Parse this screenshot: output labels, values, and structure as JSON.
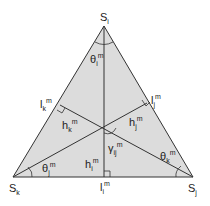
{
  "diagram": {
    "fill_color": "#dcdcdc",
    "line_color": "#333333",
    "vertices": {
      "top": {
        "base": "S",
        "sub": "i"
      },
      "bottom_left": {
        "base": "S",
        "sub": "k"
      },
      "bottom_right": {
        "base": "S",
        "sub": "j"
      }
    },
    "feet": {
      "left_side": {
        "base": "l",
        "sub": "k",
        "sup": "m"
      },
      "right_side": {
        "base": "l",
        "sub": "j",
        "sup": "m"
      },
      "bottom_side": {
        "base": "l",
        "sub": "i",
        "sup": "m"
      }
    },
    "heights": {
      "k": {
        "base": "h",
        "sub": "k",
        "sup": "m"
      },
      "j": {
        "base": "h",
        "sub": "j",
        "sup": "m"
      },
      "i": {
        "base": "h",
        "sub": "i",
        "sup": "m"
      }
    },
    "angles": {
      "theta_i": {
        "base": "θ",
        "sub": "i",
        "sup": "m"
      },
      "theta_j": {
        "base": "θ",
        "sub": "j",
        "sup": "m"
      },
      "theta_k": {
        "base": "θ",
        "sub": "k",
        "sup": "m"
      },
      "gamma_ij": {
        "base": "γ",
        "sub": "ij",
        "sup": "m"
      }
    }
  }
}
